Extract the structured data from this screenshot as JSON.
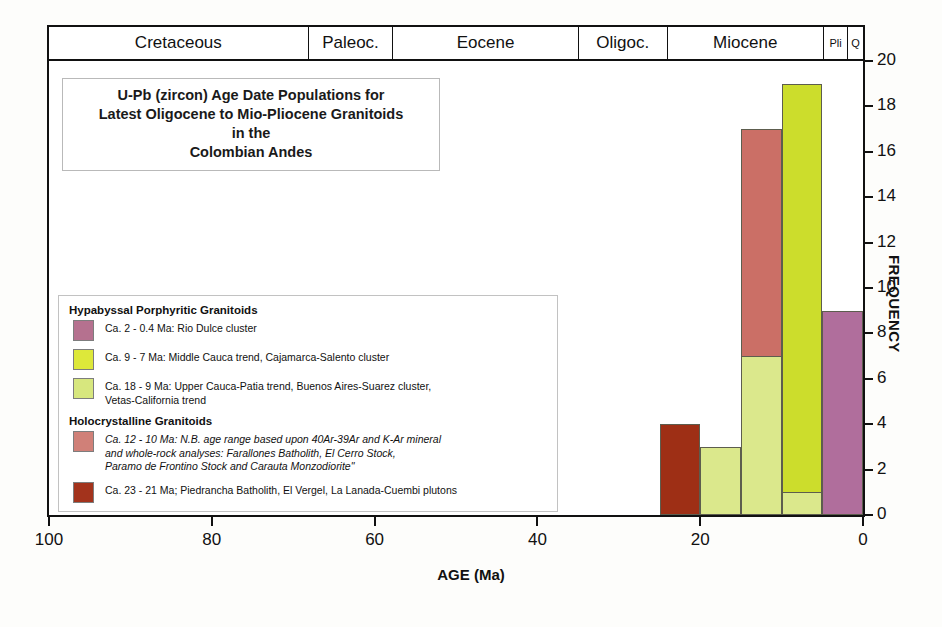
{
  "chart_data": {
    "type": "bar",
    "title": "U-Pb (zircon) Age Date Populations for Latest Oligocene to Mio-Pliocene Granitoids in the Colombian Andes",
    "xlabel": "AGE (Ma)",
    "ylabel": "FREQUENCY",
    "xlim": [
      100,
      0
    ],
    "ylim": [
      0,
      20
    ],
    "x_ticks": [
      100,
      80,
      60,
      40,
      20,
      0
    ],
    "y_ticks": [
      0,
      2,
      4,
      6,
      8,
      10,
      12,
      14,
      16,
      18,
      20
    ],
    "grid": false,
    "legend_position": "inside-left",
    "bin_width_ma": 5,
    "bins": [
      {
        "label": "25-20 Ma",
        "x_start": 25,
        "x_end": 20,
        "total": 4,
        "segments": [
          {
            "series": "Ca. 23 - 21 Ma holocrystalline",
            "value": 4,
            "color": "#9e2f15"
          }
        ]
      },
      {
        "label": "20-15 Ma",
        "x_start": 20,
        "x_end": 15,
        "total": 3,
        "segments": [
          {
            "series": "Ca. 18 - 9 Ma hypabyssal",
            "value": 3,
            "color": "#dbe88c"
          }
        ]
      },
      {
        "label": "15-10 Ma",
        "x_start": 15,
        "x_end": 10,
        "total": 17,
        "segments": [
          {
            "series": "Ca. 18 - 9 Ma hypabyssal",
            "value": 7,
            "color": "#dbe88c"
          },
          {
            "series": "Ca. 12 - 10 Ma holocrystalline",
            "value": 10,
            "color": "#cb6f66"
          }
        ]
      },
      {
        "label": "10-5 Ma",
        "x_start": 10,
        "x_end": 5,
        "total": 19,
        "segments": [
          {
            "series": "Ca. 18 - 9 Ma hypabyssal",
            "value": 1,
            "color": "#dbe88c"
          },
          {
            "series": "Ca. 9 - 7 Ma hypabyssal",
            "value": 18,
            "color": "#ccdd2c"
          }
        ]
      },
      {
        "label": "5-0 Ma",
        "x_start": 5,
        "x_end": 0,
        "total": 9,
        "segments": [
          {
            "series": "Ca. 2 - 0.4 Ma hypabyssal",
            "value": 9,
            "color": "#b06e9c"
          }
        ]
      }
    ]
  },
  "timescale": {
    "cells": [
      {
        "label": "Cretaceous",
        "width_pct": 31.9,
        "small": false
      },
      {
        "label": "Paleoc.",
        "width_pct": 10.4,
        "small": false
      },
      {
        "label": "Eocene",
        "width_pct": 22.8,
        "small": false
      },
      {
        "label": "Oligoc.",
        "width_pct": 10.9,
        "small": false
      },
      {
        "label": "Miocene",
        "width_pct": 19.2,
        "small": false
      },
      {
        "label": "Pli",
        "width_pct": 3.0,
        "small": true
      },
      {
        "label": "Q",
        "width_pct": 1.8,
        "small": true
      }
    ]
  },
  "title_box": {
    "line1": "U-Pb (zircon) Age Date Populations for",
    "line2": "Latest Oligocene to Mio-Pliocene Granitoids",
    "line3": "in the",
    "line4": "Colombian Andes"
  },
  "legend": {
    "group1_heading": "Hypabyssal Porphyritic Granitoids",
    "group2_heading": "Holocrystalline Granitoids",
    "items": [
      {
        "color": "#b5718f",
        "line1": "Ca. 2 - 0.4 Ma: Rio Dulce cluster",
        "line2": "",
        "line3": ""
      },
      {
        "color": "#dde83a",
        "line1": "Ca. 9 - 7 Ma: Middle Cauca trend, Cajamarca-Salento cluster",
        "line2": "",
        "line3": ""
      },
      {
        "color": "#d7e77e",
        "line1": "Ca. 18 - 9 Ma: Upper Cauca-Patia trend, Buenos Aires-Suarez cluster,",
        "line2": "Vetas-California trend",
        "line3": ""
      },
      {
        "color": "#d08078",
        "line1": "Ca. 12 - 10 Ma: N.B. age range based upon 40Ar-39Ar and K-Ar mineral",
        "line2": "and whole-rock analyses: Farallones Batholith, El Cerro Stock,",
        "line3": "Paramo de Frontino Stock and Carauta Monzodiorite\""
      },
      {
        "color": "#a3331c",
        "line1": "Ca. 23 - 21 Ma; Piedrancha Batholith, El Vergel, La Lanada-Cuembi plutons",
        "line2": "",
        "line3": ""
      }
    ]
  },
  "axes": {
    "x_title": "AGE (Ma)",
    "y_title": "FREQUENCY",
    "x_tick_labels": [
      "100",
      "80",
      "60",
      "40",
      "20",
      "0"
    ],
    "y_tick_labels": [
      "0",
      "2",
      "4",
      "6",
      "8",
      "10",
      "12",
      "14",
      "16",
      "18",
      "20"
    ]
  }
}
